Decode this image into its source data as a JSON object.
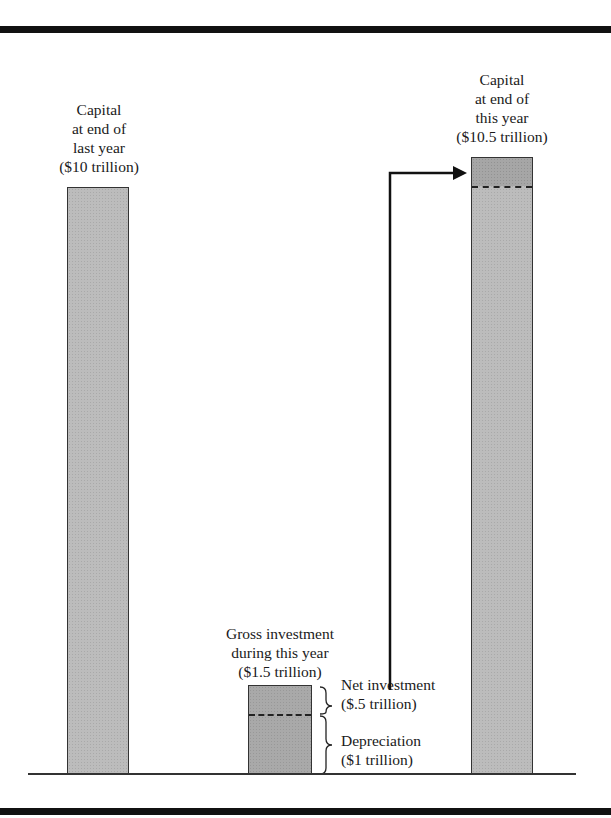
{
  "diagram": {
    "bars": [
      {
        "id": "capital-last-year",
        "label_lines": [
          "Capital",
          "at end of",
          "last year",
          "($10 trillion)"
        ],
        "value": 10
      },
      {
        "id": "gross-investment",
        "label_lines": [
          "Gross investment",
          "during this year",
          "($1.5 trillion)"
        ],
        "value": 1.5,
        "segments": [
          {
            "name": "Net investment",
            "value_text": "($.5 trillion)",
            "value": 0.5
          },
          {
            "name": "Depreciation",
            "value_text": "($1 trillion)",
            "value": 1
          }
        ]
      },
      {
        "id": "capital-this-year",
        "label_lines": [
          "Capital",
          "at end of",
          "this year",
          "($10.5 trillion)"
        ],
        "value": 10.5
      }
    ],
    "annotations": {
      "net_investment": [
        "Net investment",
        "($.5 trillion)"
      ],
      "depreciation": [
        "Depreciation",
        "($1 trillion)"
      ]
    },
    "arrow": {
      "from": "net investment portion",
      "to": "top of capital at end of this year"
    },
    "colors": {
      "bar_fill": "#bcbcbc",
      "bar_fill_dark": "#a6a6a6",
      "outline": "#333333",
      "rule": "#111111"
    }
  }
}
